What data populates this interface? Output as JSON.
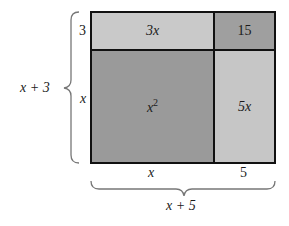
{
  "diagram": {
    "type": "area-model",
    "cells": [
      {
        "id": "top-left",
        "label": "3x",
        "color": "#c9c9c9"
      },
      {
        "id": "top-right",
        "label": "15",
        "color": "#9f9f9f"
      },
      {
        "id": "bottom-left",
        "label": "x",
        "superscript": "2",
        "color": "#9a9a9a"
      },
      {
        "id": "bottom-right",
        "label": "5x",
        "color": "#c6c6c6"
      }
    ],
    "left_side": {
      "segments": [
        "3",
        "x"
      ],
      "total": "x + 3"
    },
    "bottom_side": {
      "segments": [
        "x",
        "5"
      ],
      "total": "x + 5"
    },
    "border_color": "#111111",
    "brace_color": "#777777"
  }
}
